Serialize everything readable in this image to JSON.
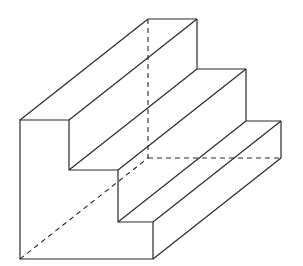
{
  "diagram": {
    "title": "",
    "colors": {
      "line": "#2a2a2a",
      "background": "#ffffff"
    },
    "front_face": [
      [
        20,
        120
      ],
      [
        69,
        120
      ],
      [
        69,
        170
      ],
      [
        118,
        170
      ],
      [
        118,
        222
      ],
      [
        153,
        222
      ],
      [
        153,
        259
      ],
      [
        20,
        259
      ]
    ],
    "depth_offset": [
      128,
      -101
    ],
    "visible_edges": [
      [
        [
          20,
          120
        ],
        [
          148,
          19
        ]
      ],
      [
        [
          69,
          120
        ],
        [
          197,
          19
        ]
      ],
      [
        [
          148,
          19
        ],
        [
          197,
          19
        ]
      ],
      [
        [
          197,
          19
        ],
        [
          197,
          69
        ]
      ],
      [
        [
          69,
          170
        ],
        [
          197,
          69
        ]
      ],
      [
        [
          118,
          170
        ],
        [
          246,
          69
        ]
      ],
      [
        [
          197,
          69
        ],
        [
          246,
          69
        ]
      ],
      [
        [
          246,
          69
        ],
        [
          246,
          121
        ]
      ],
      [
        [
          118,
          222
        ],
        [
          246,
          121
        ]
      ],
      [
        [
          153,
          222
        ],
        [
          281,
          121
        ]
      ],
      [
        [
          246,
          121
        ],
        [
          281,
          121
        ]
      ],
      [
        [
          281,
          121
        ],
        [
          281,
          158
        ]
      ],
      [
        [
          153,
          259
        ],
        [
          281,
          158
        ]
      ]
    ],
    "hidden_edges": [
      [
        [
          148,
          19
        ],
        [
          148,
          158
        ]
      ],
      [
        [
          148,
          158
        ],
        [
          281,
          158
        ]
      ],
      [
        [
          20,
          259
        ],
        [
          148,
          158
        ]
      ]
    ]
  }
}
